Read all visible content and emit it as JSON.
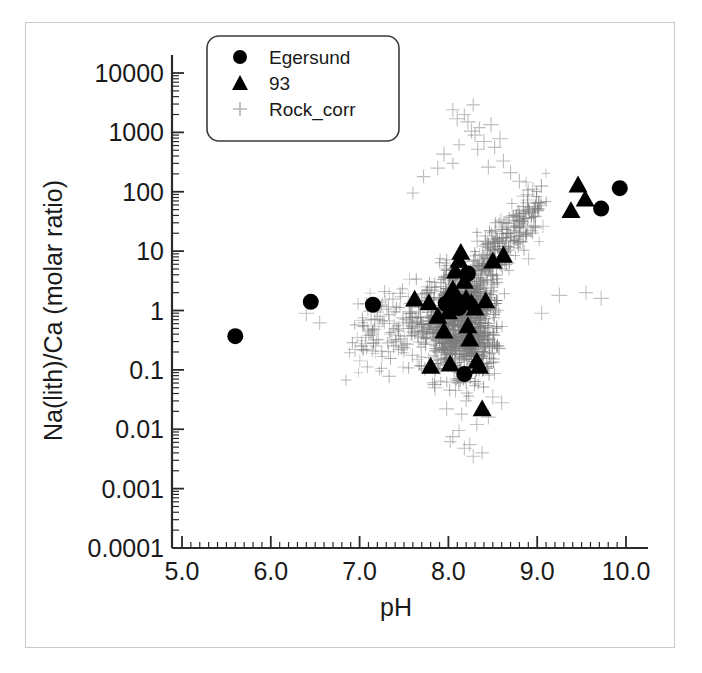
{
  "chart_data": {
    "type": "scatter",
    "title": "",
    "xlabel": "pH",
    "ylabel": "Na(lith)/Ca (molar ratio)",
    "xlim": [
      4.5,
      10.4
    ],
    "ylim": [
      0.0001,
      10000
    ],
    "yscale": "log",
    "xscale": "linear",
    "grid": false,
    "xticks": [
      5.0,
      6.0,
      7.0,
      8.0,
      9.0,
      10.0
    ],
    "xticklabels": [
      "5.0",
      "6.0",
      "7.0",
      "8.0",
      "9.0",
      "10.0"
    ],
    "yticks": [
      0.0001,
      0.001,
      0.01,
      0.1,
      1,
      10,
      100,
      1000,
      10000
    ],
    "yticklabels": [
      "0.0001",
      "0.001",
      "0.01",
      "0.1",
      "1",
      "10",
      "100",
      "1000",
      "10000"
    ],
    "legend_position": "upper-left-inside",
    "series": [
      {
        "name": "Egersund",
        "marker": "circle",
        "color": "#000000",
        "size": 11,
        "points": [
          [
            5.6,
            0.37
          ],
          [
            6.45,
            1.4
          ],
          [
            7.15,
            1.25
          ],
          [
            7.97,
            1.3
          ],
          [
            8.03,
            1.55
          ],
          [
            8.1,
            1.45
          ],
          [
            8.12,
            1.1
          ],
          [
            8.22,
            4.2
          ],
          [
            8.18,
            0.085
          ],
          [
            9.72,
            52
          ],
          [
            9.93,
            115
          ]
        ]
      },
      {
        "name": "93",
        "marker": "triangle",
        "color": "#000000",
        "size": 12,
        "points": [
          [
            7.62,
            1.55
          ],
          [
            7.78,
            1.35
          ],
          [
            7.88,
            0.8
          ],
          [
            7.95,
            0.45
          ],
          [
            8.0,
            0.95
          ],
          [
            8.05,
            2.3
          ],
          [
            8.08,
            4.6
          ],
          [
            8.12,
            7.0
          ],
          [
            8.14,
            9.5
          ],
          [
            8.18,
            3.1
          ],
          [
            8.2,
            1.6
          ],
          [
            8.22,
            0.55
          ],
          [
            8.24,
            0.33
          ],
          [
            8.26,
            1.35
          ],
          [
            8.3,
            1.1
          ],
          [
            8.32,
            0.14
          ],
          [
            8.35,
            0.115
          ],
          [
            8.38,
            0.022
          ],
          [
            8.42,
            1.45
          ],
          [
            8.5,
            6.8
          ],
          [
            8.62,
            8.5
          ],
          [
            7.8,
            0.115
          ],
          [
            8.02,
            0.125
          ],
          [
            9.38,
            48
          ],
          [
            9.46,
            130
          ],
          [
            9.54,
            75
          ]
        ]
      },
      {
        "name": "Rock_corr",
        "marker": "plus",
        "color": "#8a8a8a",
        "size": 6,
        "n_points": 1400,
        "description": "dense gray plus-marker cloud; core between pH 7.6-8.8 and ratio 0.1-30, tail upward to ~2000 near pH 8.2-8.6, sparse outliers down to ~0.004 and left to pH 6.3"
      }
    ]
  },
  "legend": {
    "items": [
      {
        "label": "Egersund",
        "marker": "circle-marker-icon"
      },
      {
        "label": "93",
        "marker": "triangle-marker-icon"
      },
      {
        "label": "Rock_corr",
        "marker": "plus-marker-icon"
      }
    ]
  }
}
